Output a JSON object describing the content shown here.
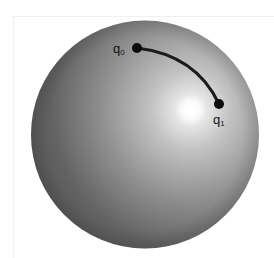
{
  "figure": {
    "sphere": {
      "cx": 145,
      "cy": 134.5,
      "r": 114,
      "highlight": {
        "cx": 191,
        "cy": 110
      },
      "colors": {
        "highlight": "#ffffff",
        "light": "#c4c4c4",
        "mid": "#8e8e8e",
        "dark": "#555555"
      }
    },
    "arc": {
      "color": "#1a1a1a",
      "width": 3
    },
    "points": [
      {
        "id": "q0",
        "label": "q",
        "subscript": "0",
        "x": 137,
        "y": 48
      },
      {
        "id": "q1",
        "label": "q",
        "subscript": "1",
        "x": 219,
        "y": 104
      }
    ]
  }
}
